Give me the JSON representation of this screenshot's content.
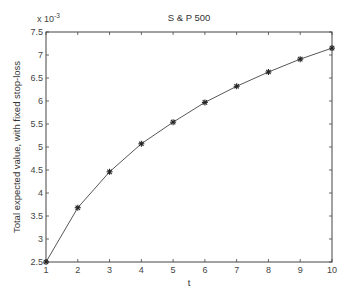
{
  "chart_data": {
    "type": "line",
    "title": "S & P 500",
    "xlabel": "t",
    "ylabel": "Total expected value, with fixed stop-loss",
    "y_multiplier_label": "x 10",
    "y_multiplier_exponent": "-3",
    "x": [
      1,
      2,
      3,
      4,
      5,
      6,
      7,
      8,
      9,
      10
    ],
    "series": [
      {
        "name": "S & P 500",
        "marker": "*",
        "color": "#333333",
        "values": [
          2.5,
          3.68,
          4.46,
          5.07,
          5.54,
          5.97,
          6.32,
          6.63,
          6.91,
          7.15
        ]
      }
    ],
    "xlim": [
      1,
      10
    ],
    "ylim": [
      2.5,
      7.5
    ],
    "xticks": [
      "1",
      "2",
      "3",
      "4",
      "5",
      "6",
      "7",
      "8",
      "9",
      "10"
    ],
    "yticks": [
      "2.5",
      "3",
      "3.5",
      "4",
      "4.5",
      "5",
      "5.5",
      "6",
      "6.5",
      "7",
      "7.5"
    ],
    "grid": false,
    "legend": null
  }
}
